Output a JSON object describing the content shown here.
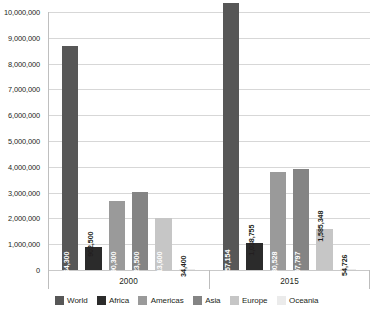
{
  "chart_data": {
    "type": "bar",
    "title": "",
    "xlabel": "",
    "ylabel": "",
    "categories": [
      "2000",
      "2015"
    ],
    "series": [
      {
        "name": "World",
        "color": "#575757",
        "values": [
          8664300,
          10357154
        ],
        "labels": [
          "8,664,300",
          "10,357,154"
        ]
      },
      {
        "name": "Africa",
        "color": "#2b2b2b",
        "values": [
          902500,
          1038755
        ],
        "labels": [
          "902,500",
          "1,038,755"
        ]
      },
      {
        "name": "Americas",
        "color": "#9a9a9a",
        "values": [
          2690300,
          3780528
        ],
        "labels": [
          "2,690,300",
          "3,780,528"
        ]
      },
      {
        "name": "Asia",
        "color": "#848484",
        "values": [
          3023500,
          3897797
        ],
        "labels": [
          "3,023,500",
          "3,897,797"
        ]
      },
      {
        "name": "Europe",
        "color": "#c6c6c6",
        "values": [
          2013600,
          1585348
        ],
        "labels": [
          "2,013,600",
          "1,585,348"
        ]
      },
      {
        "name": "Oceania",
        "color": "#ebebeb",
        "values": [
          34400,
          54726
        ],
        "labels": [
          "34,400",
          "54,726"
        ]
      }
    ],
    "ylim": [
      0,
      10000000
    ],
    "ytick_values": [
      0,
      1000000,
      2000000,
      3000000,
      4000000,
      5000000,
      6000000,
      7000000,
      8000000,
      9000000,
      10000000
    ],
    "ytick_labels": [
      "0",
      "1,000,000",
      "2,000,000",
      "3,000,000",
      "4,000,000",
      "5,000,000",
      "6,000,000",
      "7,000,000",
      "8,000,000",
      "9,000,000",
      "10,000,000"
    ],
    "grid": true,
    "legend_position": "bottom",
    "legend_entries": [
      "World",
      "Africa",
      "Americas",
      "Asia",
      "Europe",
      "Oceania"
    ],
    "label_orientation": "vertical"
  }
}
